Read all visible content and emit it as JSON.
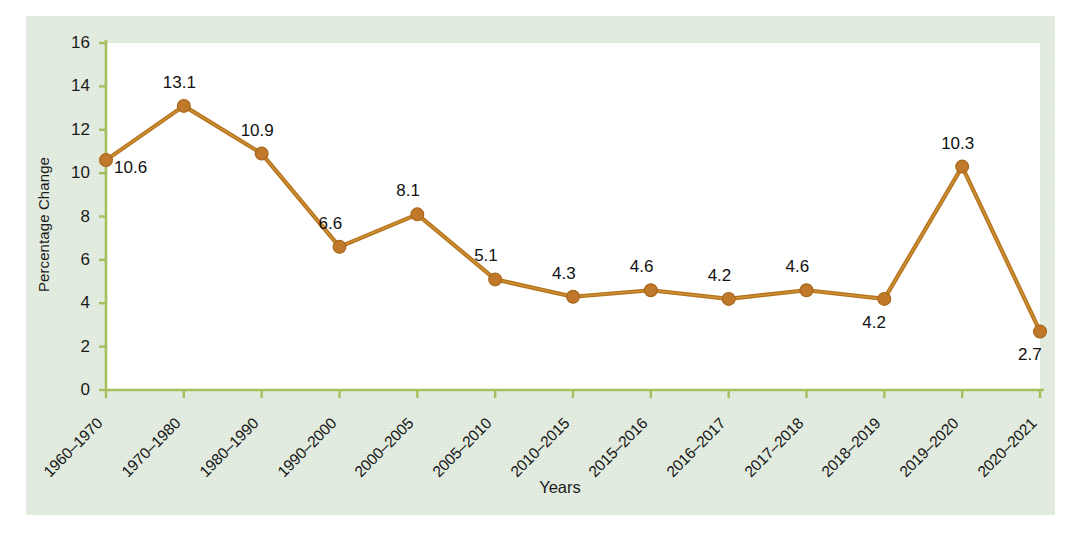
{
  "chart_data": {
    "type": "line",
    "title": "",
    "xlabel": "Years",
    "ylabel": "Percentage Change",
    "categories": [
      "1960–1970",
      "1970–1980",
      "1980–1990",
      "1990–2000",
      "2000–2005",
      "2005–2010",
      "2010–2015",
      "2015–2016",
      "2016–2017",
      "2017–2018",
      "2018–2019",
      "2019–2020",
      "2020–2021"
    ],
    "values": [
      10.6,
      13.1,
      10.9,
      6.6,
      8.1,
      5.1,
      4.3,
      4.6,
      4.2,
      4.6,
      4.2,
      10.3,
      2.7
    ],
    "point_labels": [
      "10.6",
      "13.1",
      "10.9",
      "6.6",
      "8.1",
      "5.1",
      "4.3",
      "4.6",
      "4.2",
      "4.6",
      "4.2",
      "10.3",
      "2.7"
    ],
    "label_positions": [
      "right",
      "above",
      "above",
      "above",
      "above",
      "above",
      "above",
      "above",
      "above",
      "above",
      "below",
      "above",
      "below"
    ],
    "ylim": [
      0,
      16
    ],
    "yticks": [
      0,
      2,
      4,
      6,
      8,
      10,
      12,
      14,
      16
    ],
    "ytick_labels": [
      "0",
      "2",
      "4",
      "6",
      "8",
      "10",
      "12",
      "14",
      "16"
    ],
    "grid": false,
    "legend": "none",
    "series_color": "#b5721f",
    "marker_color": "#c0792b",
    "axis_color": "#a8bd5c",
    "panel_color": "#dfe9dc",
    "plot_color": "#ffffff"
  }
}
